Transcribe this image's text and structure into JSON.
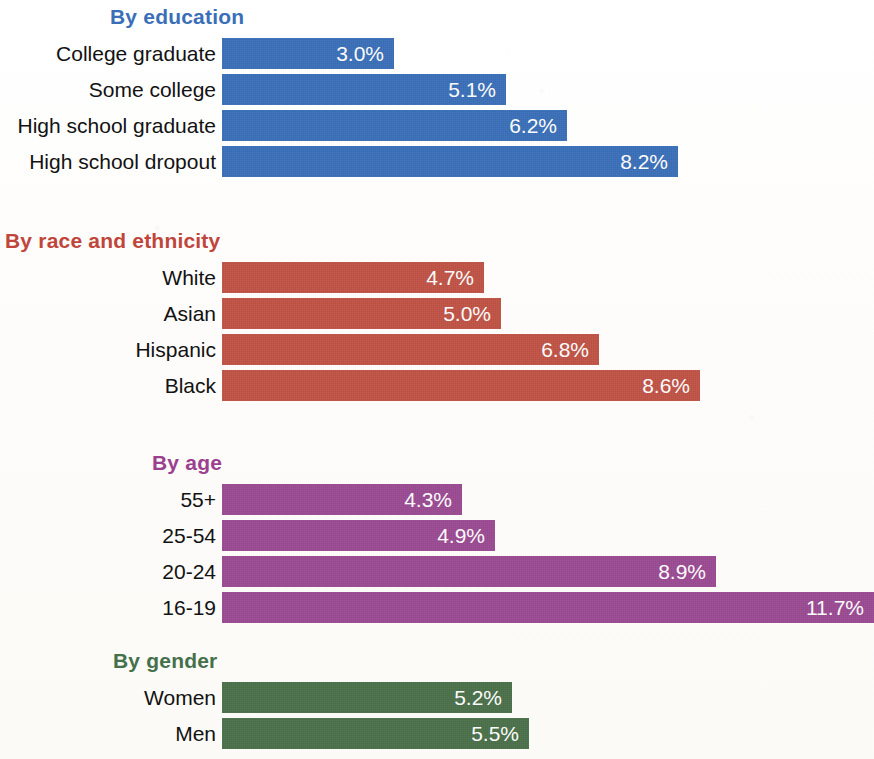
{
  "chart_data": {
    "type": "bar",
    "title": "",
    "xlabel": "",
    "ylabel": "",
    "orientation": "horizontal",
    "value_suffix": "%",
    "grid": false,
    "legend": "none",
    "xlim": [
      0,
      12.0
    ],
    "panels": [
      {
        "heading": "By education",
        "color": "#3a6fb8",
        "categories": [
          "College graduate",
          "Some college",
          "High school graduate",
          "High school dropout"
        ],
        "values": [
          3.0,
          5.1,
          6.2,
          8.2
        ],
        "labels": [
          "3.0%",
          "5.1%",
          "6.2%",
          "8.2%"
        ]
      },
      {
        "heading": "By race and ethnicity",
        "color": "#c05345",
        "categories": [
          "White",
          "Asian",
          "Hispanic",
          "Black"
        ],
        "values": [
          4.7,
          5.0,
          6.8,
          8.6
        ],
        "labels": [
          "4.7%",
          "5.0%",
          "6.8%",
          "8.6%"
        ]
      },
      {
        "heading": "By age",
        "color": "#9b4a92",
        "categories": [
          "55+",
          "25-54",
          "20-24",
          "16-19"
        ],
        "values": [
          4.3,
          4.9,
          8.9,
          11.7
        ],
        "labels": [
          "4.3%",
          "4.9%",
          "8.9%",
          "11.7%"
        ]
      },
      {
        "heading": "By gender",
        "color": "#4a7049",
        "categories": [
          "Women",
          "Men"
        ],
        "values": [
          5.2,
          5.5
        ],
        "labels": [
          "5.2%",
          "5.5%"
        ]
      }
    ]
  },
  "panels": [
    {
      "heading": "By education",
      "heading_left": 110,
      "heading_color": "#3a6fb8",
      "top": 4,
      "rows_top": 38,
      "bar_color": "#3a6fb8",
      "rows": [
        {
          "label": "College graduate",
          "value": "3.0%",
          "width": 172
        },
        {
          "label": "Some college",
          "value": "5.1%",
          "width": 284
        },
        {
          "label": "High school graduate",
          "value": "6.2%",
          "width": 345
        },
        {
          "label": "High school dropout",
          "value": "8.2%",
          "width": 456
        }
      ]
    },
    {
      "heading": "By race and ethnicity",
      "heading_left": 5,
      "heading_color": "#c0453a",
      "top": 228,
      "rows_top": 262,
      "bar_color": "#c05345",
      "rows": [
        {
          "label": "White",
          "value": "4.7%",
          "width": 262
        },
        {
          "label": "Asian",
          "value": "5.0%",
          "width": 279
        },
        {
          "label": "Hispanic",
          "value": "6.8%",
          "width": 377
        },
        {
          "label": "Black",
          "value": "8.6%",
          "width": 478
        }
      ]
    },
    {
      "heading": "By age",
      "heading_left": 152,
      "heading_color": "#9b3f8f",
      "top": 450,
      "rows_top": 484,
      "bar_color": "#9b4a92",
      "rows": [
        {
          "label": "55+",
          "value": "4.3%",
          "width": 240
        },
        {
          "label": "25-54",
          "value": "4.9%",
          "width": 273
        },
        {
          "label": "20-24",
          "value": "8.9%",
          "width": 494
        },
        {
          "label": "16-19",
          "value": "11.7%",
          "width": 652
        }
      ]
    },
    {
      "heading": "By gender",
      "heading_left": 113,
      "heading_color": "#44704a",
      "top": 648,
      "rows_top": 682,
      "bar_color": "#4a7049",
      "rows": [
        {
          "label": "Women",
          "value": "5.2%",
          "width": 290
        },
        {
          "label": "Men",
          "value": "5.5%",
          "width": 307
        }
      ]
    }
  ]
}
